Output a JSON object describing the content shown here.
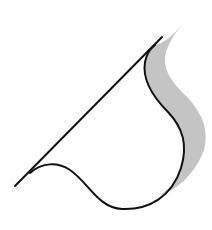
{
  "diagram": {
    "title": "",
    "background": "#ffffff",
    "shapes": [
      {
        "id": "straight-line",
        "kind": "line",
        "from": [
          15,
          186
        ],
        "to": [
          162,
          37
        ],
        "stroke": "#111111",
        "stroke_width": 2
      },
      {
        "id": "black-curve",
        "kind": "path",
        "d": "M 30 173 C 42 162, 58 162, 70 170 C 88 182, 98 208, 122 209 C 150 210, 172 196, 181 168 C 188 145, 183 128, 168 112 C 152 96, 142 80, 145 62 C 147 52, 151 48, 155 45",
        "stroke": "#111111",
        "stroke_width": 2,
        "fill": "none"
      },
      {
        "id": "gray-band",
        "kind": "path",
        "d": "M 183 24 C 172 36, 163 44, 155 45 C 151 48, 147 52, 145 62 C 142 80, 152 96, 168 112 C 183 128, 188 145, 181 168 C 176 182, 168 190, 160 195 C 178 190, 196 172, 204 150 C 210 128, 200 110, 185 95 C 170 80, 162 68, 166 52 C 170 40, 176 32, 183 24 Z",
        "fill": "#c4c4c4",
        "stroke": "none"
      }
    ],
    "labels": []
  }
}
